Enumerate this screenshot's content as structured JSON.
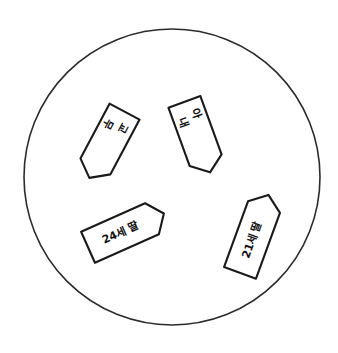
{
  "figure": {
    "boundary": {
      "name": "family-boundary-circle",
      "shape": "circle",
      "cx": 172,
      "cy": 177,
      "r": 148,
      "stroke_color": "#2b2b2b",
      "fill_color": "#ffffff"
    },
    "markers": [
      {
        "id": "marker-gyomu",
        "label": "교무",
        "label_lines": [
          "교",
          "무"
        ],
        "position": {
          "x": 110,
          "y": 139
        },
        "shape_rotation_deg": 208,
        "text_rotation_deg": 118,
        "point_direction": "upper-left",
        "outline_color": "#1a1a1a",
        "fill_color": "#ffffff",
        "width": 34,
        "height": 62
      },
      {
        "id": "marker-wife",
        "label": "아내",
        "label_lines": [
          "아",
          "내"
        ],
        "position": {
          "x": 195,
          "y": 131
        },
        "shape_rotation_deg": 160,
        "text_rotation_deg": 70,
        "point_direction": "down",
        "outline_color": "#1a1a1a",
        "fill_color": "#ffffff",
        "width": 34,
        "height": 62
      },
      {
        "id": "marker-daughter-24",
        "label": "24세 딸",
        "label_lines": [
          "24세 딸"
        ],
        "position": {
          "x": 120,
          "y": 233
        },
        "shape_rotation_deg": 66,
        "text_rotation_deg": -24,
        "point_direction": "upper-right",
        "outline_color": "#1a1a1a",
        "fill_color": "#ffffff",
        "width": 34,
        "height": 70
      },
      {
        "id": "marker-daughter-21",
        "label": "21세 딸",
        "label_lines": [
          "21세 딸"
        ],
        "position": {
          "x": 252,
          "y": 240
        },
        "shape_rotation_deg": 20,
        "text_rotation_deg": -70,
        "point_direction": "upper-right",
        "outline_color": "#1a1a1a",
        "fill_color": "#ffffff",
        "width": 34,
        "height": 70
      }
    ]
  }
}
